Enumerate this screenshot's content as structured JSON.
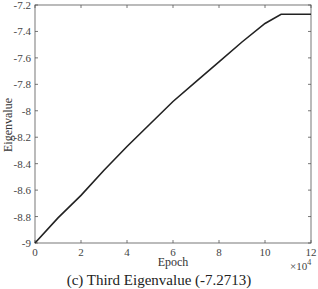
{
  "chart_data": {
    "type": "line",
    "title": "",
    "caption": "(c) Third Eigenvalue (-7.2713)",
    "xlabel": "Epoch",
    "ylabel": "Eigenvalue",
    "x_multiplier": "×10^4",
    "xlim": [
      0,
      12
    ],
    "ylim": [
      -9,
      -7.2
    ],
    "xticks": [
      0,
      2,
      4,
      6,
      8,
      10,
      12
    ],
    "yticks": [
      -9,
      -8.8,
      -8.6,
      -8.4,
      -8.2,
      -8,
      -7.8,
      -7.6,
      -7.4,
      -7.2
    ],
    "grid": false,
    "legend": null,
    "series": [
      {
        "name": "Eigenvalue",
        "color": "#222222",
        "x": [
          0,
          1,
          2,
          3,
          4,
          5,
          6,
          7,
          8,
          9,
          10,
          10.7,
          11,
          12
        ],
        "y": [
          -9.0,
          -8.81,
          -8.64,
          -8.45,
          -8.27,
          -8.1,
          -7.93,
          -7.78,
          -7.63,
          -7.48,
          -7.34,
          -7.27,
          -7.27,
          -7.27
        ]
      }
    ]
  },
  "labels": {
    "xlabel": "Epoch",
    "ylabel": "Eigenvalue",
    "x_exp_base": "×10",
    "x_exp_power": "4",
    "caption": "(c) Third Eigenvalue (-7.2713)"
  }
}
